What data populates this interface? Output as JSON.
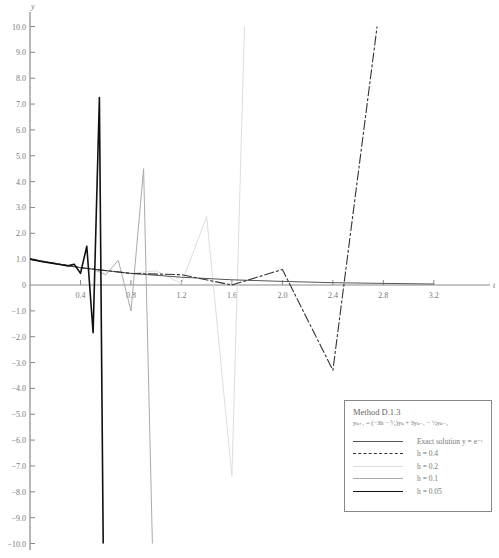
{
  "chart_data": {
    "type": "line",
    "title": "Method D.1.3",
    "formula": "yₖ₊₁ = (−3h − ³⁄₂)yₖ + 3yₖ₋₁ − ½yₖ₋₂",
    "xlabel": "t",
    "ylabel": "y",
    "xlim": [
      0,
      3.6
    ],
    "ylim": [
      -10.0,
      10.0
    ],
    "grid": false,
    "legend_position": "lower right",
    "x_ticks": [
      "0.4",
      "0.8",
      "1.2",
      "1.6",
      "2.0",
      "2.4",
      "2.8",
      "3.2"
    ],
    "y_ticks": [
      "10.0",
      "9.0",
      "8.0",
      "7.0",
      "6.0",
      "5.0",
      "4.0",
      "3.0",
      "2.0",
      "1.0",
      "0",
      "-1.0",
      "-2.0",
      "-3.0",
      "-4.0",
      "-5.0",
      "-6.0",
      "-7.0",
      "-8.0",
      "-9.0",
      "-10.0"
    ],
    "series": [
      {
        "name": "Exact solution y = e^-t",
        "color": "#555555",
        "width": 1.0,
        "dash": "",
        "x": [
          0,
          0.4,
          0.8,
          1.2,
          1.6,
          2.0,
          2.4,
          2.8,
          3.2
        ],
        "y": [
          1.0,
          0.67,
          0.45,
          0.3,
          0.2,
          0.14,
          0.09,
          0.06,
          0.04
        ]
      },
      {
        "name": "h = 0.4",
        "color": "#333333",
        "width": 1.1,
        "dash": "10 2 3 2",
        "x": [
          0,
          0.4,
          0.8,
          1.2,
          1.6,
          2.0,
          2.4,
          2.75
        ],
        "y": [
          1.0,
          0.67,
          0.45,
          0.4,
          0.0,
          0.6,
          -3.3,
          10.0
        ]
      },
      {
        "name": "h = 0.2",
        "color": "#dddddd",
        "width": 1.0,
        "dash": "",
        "x": [
          0,
          0.2,
          0.4,
          0.6,
          0.8,
          1.0,
          1.2,
          1.4,
          1.6,
          1.7
        ],
        "y": [
          1.0,
          0.82,
          0.67,
          0.55,
          0.45,
          0.55,
          0.05,
          2.65,
          -7.4,
          10.0
        ]
      },
      {
        "name": "h = 0.1",
        "color": "#aaaaaa",
        "width": 1.0,
        "dash": "",
        "x": [
          0,
          0.1,
          0.2,
          0.3,
          0.4,
          0.5,
          0.6,
          0.7,
          0.8,
          0.9,
          0.97
        ],
        "y": [
          1.0,
          0.9,
          0.82,
          0.74,
          0.67,
          0.61,
          0.4,
          0.95,
          -1.0,
          4.5,
          -10.0
        ]
      },
      {
        "name": "h = 0.05",
        "color": "#111111",
        "width": 1.6,
        "dash": "",
        "x": [
          0,
          0.05,
          0.1,
          0.15,
          0.2,
          0.25,
          0.3,
          0.35,
          0.4,
          0.45,
          0.5,
          0.55,
          0.58
        ],
        "y": [
          1.0,
          0.95,
          0.9,
          0.86,
          0.82,
          0.78,
          0.74,
          0.8,
          0.45,
          1.5,
          -1.85,
          7.25,
          -10.0
        ]
      }
    ]
  },
  "legend": {
    "title": "Method D.1.3",
    "formula": "yₖ₊₁ = (−3h − ³⁄₂)yₖ + 3yₖ₋₁ − ½yₖ₋₂",
    "items": [
      {
        "label": "Exact solution y = e⁻ᵗ"
      },
      {
        "label": "h = 0.4"
      },
      {
        "label": "h = 0.2"
      },
      {
        "label": "h = 0.1"
      },
      {
        "label": "h = 0.05"
      }
    ]
  },
  "axes": {
    "x_label": "t",
    "y_label": "y"
  }
}
